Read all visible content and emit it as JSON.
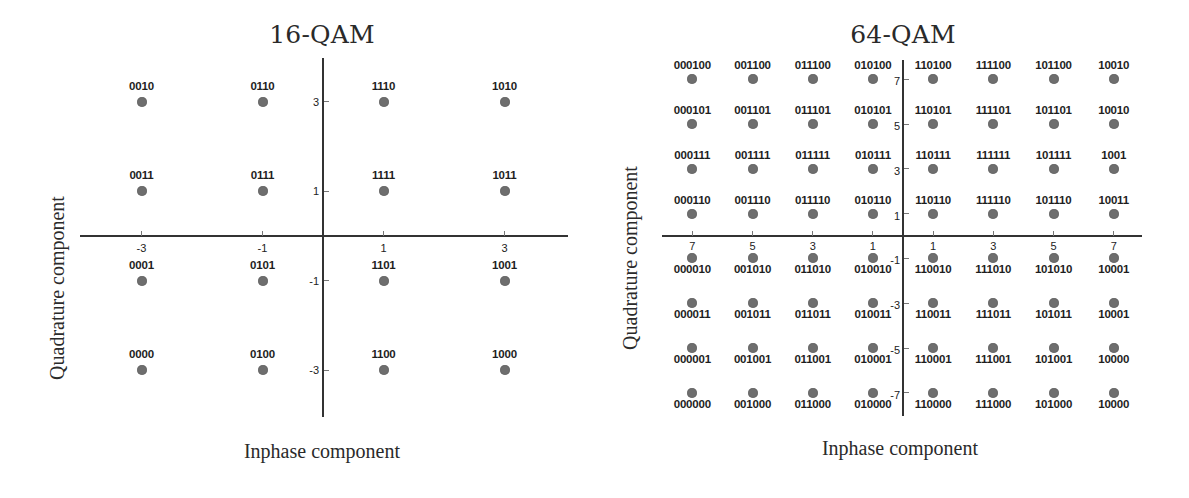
{
  "chart_data": [
    {
      "type": "scatter",
      "title": "16-QAM",
      "xlabel": "Inphase component",
      "ylabel": "Quadrature component",
      "xlim": [
        -4,
        4
      ],
      "ylim": [
        -4,
        4
      ],
      "grid": false,
      "legend": null,
      "x_ticks": [
        -3,
        -1,
        1,
        3
      ],
      "x_tick_labels": [
        "-3",
        "-1",
        "1",
        "3"
      ],
      "y_ticks": [
        3,
        1,
        -1,
        -3
      ],
      "y_tick_labels": [
        "3",
        "1",
        "-1",
        "-3"
      ],
      "label_position": "above",
      "points": [
        {
          "i": -3,
          "q": 3,
          "label": "0010"
        },
        {
          "i": -1,
          "q": 3,
          "label": "0110"
        },
        {
          "i": 1,
          "q": 3,
          "label": "1110"
        },
        {
          "i": 3,
          "q": 3,
          "label": "1010"
        },
        {
          "i": -3,
          "q": 1,
          "label": "0011"
        },
        {
          "i": -1,
          "q": 1,
          "label": "0111"
        },
        {
          "i": 1,
          "q": 1,
          "label": "1111"
        },
        {
          "i": 3,
          "q": 1,
          "label": "1011"
        },
        {
          "i": -3,
          "q": -1,
          "label": "0001"
        },
        {
          "i": -1,
          "q": -1,
          "label": "0101"
        },
        {
          "i": 1,
          "q": -1,
          "label": "1101"
        },
        {
          "i": 3,
          "q": -1,
          "label": "1001"
        },
        {
          "i": -3,
          "q": -3,
          "label": "0000"
        },
        {
          "i": -1,
          "q": -3,
          "label": "0100"
        },
        {
          "i": 1,
          "q": -3,
          "label": "1100"
        },
        {
          "i": 3,
          "q": -3,
          "label": "1000"
        }
      ]
    },
    {
      "type": "scatter",
      "title": "64-QAM",
      "xlabel": "Inphase component",
      "ylabel": "Quadrature component",
      "xlim": [
        -8,
        8
      ],
      "ylim": [
        -8,
        8
      ],
      "grid": false,
      "legend": null,
      "x_ticks": [
        -7,
        -5,
        -3,
        -1,
        1,
        3,
        5,
        7
      ],
      "x_tick_labels": [
        "7",
        "5",
        "3",
        "1",
        "1",
        "3",
        "5",
        "7"
      ],
      "y_ticks": [
        7,
        5,
        3,
        1,
        -1,
        -3,
        -5,
        -7
      ],
      "y_tick_labels": [
        "7",
        "5",
        "3",
        "1",
        "-1",
        "-3",
        "-5",
        "-7"
      ],
      "label_position": "above for q>0, below for q<0",
      "rows": [
        {
          "q": 7,
          "labels": [
            "000100",
            "001100",
            "011100",
            "010100",
            "110100",
            "111100",
            "101100",
            "10010"
          ]
        },
        {
          "q": 5,
          "labels": [
            "000101",
            "001101",
            "011101",
            "010101",
            "110101",
            "111101",
            "101101",
            "10010"
          ]
        },
        {
          "q": 3,
          "labels": [
            "000111",
            "001111",
            "011111",
            "010111",
            "110111",
            "111111",
            "101111",
            "1001"
          ]
        },
        {
          "q": 1,
          "labels": [
            "000110",
            "001110",
            "011110",
            "010110",
            "110110",
            "111110",
            "101110",
            "10011"
          ]
        },
        {
          "q": -1,
          "labels": [
            "000010",
            "001010",
            "011010",
            "010010",
            "110010",
            "111010",
            "101010",
            "10001"
          ]
        },
        {
          "q": -3,
          "labels": [
            "000011",
            "001011",
            "011011",
            "010011",
            "110011",
            "111011",
            "101011",
            "10001"
          ]
        },
        {
          "q": -5,
          "labels": [
            "000001",
            "001001",
            "011001",
            "010001",
            "110001",
            "111001",
            "101001",
            "10000"
          ]
        },
        {
          "q": -7,
          "labels": [
            "000000",
            "001000",
            "011000",
            "010000",
            "110000",
            "111000",
            "101000",
            "10000"
          ]
        }
      ],
      "i_values": [
        -7,
        -5,
        -3,
        -1,
        1,
        3,
        5,
        7
      ]
    }
  ],
  "colors": {
    "point": "#6e6e6e",
    "axis": "#333333",
    "text": "#222222"
  }
}
